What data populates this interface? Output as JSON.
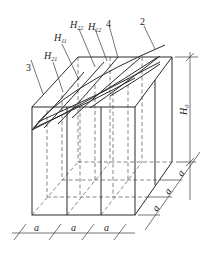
{
  "diagram": {
    "type": "isometric box with curved surface grid",
    "callouts": {
      "c2": "2",
      "c3": "3",
      "c4": "4"
    },
    "labels": {
      "H11": {
        "base": "H",
        "sub": "11"
      },
      "H12": {
        "base": "H",
        "sub": "12"
      },
      "H21": {
        "base": "H",
        "sub": "21"
      },
      "H22": {
        "base": "H",
        "sub": "22"
      },
      "H0": {
        "base": "H",
        "sub": "0"
      }
    },
    "dimensions": {
      "width_segments": [
        "a",
        "a",
        "a"
      ],
      "depth_segments": [
        "a",
        "a",
        "a"
      ],
      "height": "H0"
    },
    "colors": {
      "line": "#2a2a2a",
      "background": "#ffffff"
    }
  }
}
